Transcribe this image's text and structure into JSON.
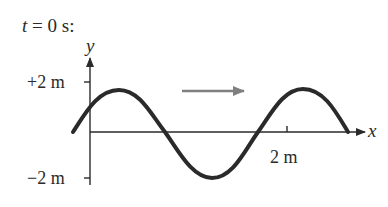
{
  "title": {
    "variable": "t",
    "rest": " = 0 s:"
  },
  "axes": {
    "x_label": "x",
    "y_label": "y",
    "y_ticks": [
      {
        "label": "+2 m",
        "value": 2
      },
      {
        "label": "−2 m",
        "value": -2
      }
    ],
    "x_ticks": [
      {
        "label": "2 m",
        "value": 2
      }
    ]
  },
  "wave": {
    "amplitude_m": 2,
    "wavelength_m": 2,
    "direction": "positive-x",
    "color": "#2a2a2a"
  },
  "propagation_arrow": {
    "color": "#808080",
    "meaning": "wave travels to the right"
  }
}
